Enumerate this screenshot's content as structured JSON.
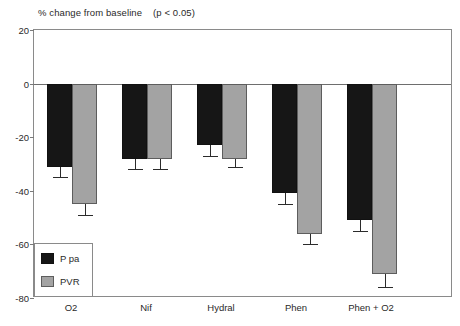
{
  "chart_data": {
    "type": "bar",
    "title": "% change from baseline    (p < 0.05)",
    "title_main": "% change from baseline",
    "title_note": "(p < 0.05)",
    "xlabel": "",
    "ylabel": "",
    "ylim": [
      -80,
      20
    ],
    "yticks": [
      20,
      0,
      -20,
      -40,
      -60,
      -80
    ],
    "ytick_labels": [
      "20",
      "0",
      "-20",
      "-40",
      "-60",
      "-80"
    ],
    "grid": false,
    "legend_position": "inside-bottom-left",
    "categories": [
      "O2",
      "Nif",
      "Hydral",
      "Phen",
      "Phen + O2"
    ],
    "series": [
      {
        "name": "P pa",
        "color": "#161616",
        "values": [
          -31,
          -28,
          -23,
          -41,
          -51
        ],
        "errors": [
          4,
          4,
          4,
          4,
          4
        ]
      },
      {
        "name": "PVR",
        "color": "#a3a3a3",
        "values": [
          -45,
          -28,
          -28,
          -56,
          -71
        ],
        "errors": [
          4,
          4,
          3,
          4,
          5
        ]
      }
    ]
  },
  "axis": {
    "zero_value": 0
  },
  "legend": {
    "entries": [
      {
        "label": "P pa",
        "swatch": "black-swatch-icon"
      },
      {
        "label": "PVR",
        "swatch": "gray-swatch-icon"
      }
    ]
  }
}
